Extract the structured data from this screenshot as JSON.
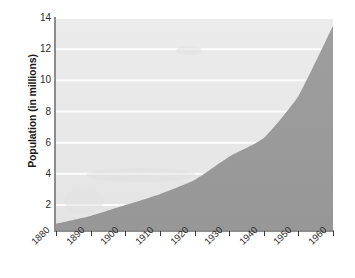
{
  "chart_data": {
    "type": "area",
    "title": "",
    "xlabel": "",
    "ylabel": "Population (in millions)",
    "x": [
      1880,
      1890,
      1900,
      1910,
      1920,
      1930,
      1940,
      1950,
      1960
    ],
    "values": [
      0.8,
      1.3,
      2.0,
      2.7,
      3.6,
      5.1,
      6.3,
      9.0,
      13.5
    ],
    "series": [
      {
        "name": "Population",
        "values": [
          0.8,
          1.3,
          2.0,
          2.7,
          3.6,
          5.1,
          6.3,
          9.0,
          13.5
        ]
      }
    ],
    "xlim": [
      1880,
      1960
    ],
    "ylim": [
      0.4,
      14
    ],
    "x_tick_labels": [
      "1880",
      "1890",
      "1900",
      "1910",
      "1920",
      "1930",
      "1940",
      "1950",
      "1960"
    ],
    "y_tick_labels": [
      "2",
      "4",
      "6",
      "8",
      "10",
      "12",
      "14"
    ],
    "y_ticks": [
      2,
      4,
      6,
      8,
      10,
      12,
      14
    ],
    "grid": "horizontal",
    "legend": "none",
    "colors": {
      "area_fill": "#9a9a9a",
      "plot_background": "#e9e9e9",
      "gridline": "#fdfdfd",
      "axis": "#8c8c8c",
      "text": "#2b2b2b",
      "page_background": "#ffffff"
    }
  }
}
